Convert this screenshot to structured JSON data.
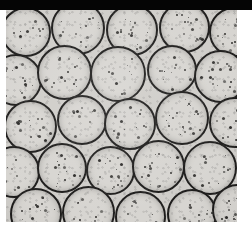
{
  "image": {
    "kind": "grayscale-micrograph",
    "subject": "densely packed spherical cells with dark outlines and internal dark speckle inclusions",
    "alt_text": "Light micrograph of closely packed round cells in a hexagonal-like arrangement",
    "canvas": {
      "width": 252,
      "height": 242
    },
    "field": {
      "x": 6,
      "y": 10,
      "width": 231,
      "height": 212
    },
    "top_band": {
      "height": 10,
      "color": "#050505"
    },
    "colors": {
      "page_background": "#ffffff",
      "field_background": "#cfcdc9",
      "cell_fill": "#d7d5d1",
      "cell_outline": "#1d1c1b",
      "inclusion": "#2a2927",
      "top_band": "#050505"
    },
    "cell_geometry": {
      "mean_diameter_px": 52,
      "outline_width_px": 2,
      "packing": "hexagonal-close-packed",
      "approx_count": 30
    },
    "cells": [
      {
        "cx": 20,
        "cy": 22,
        "d": 50,
        "seed": 3
      },
      {
        "cx": 72,
        "cy": 18,
        "d": 54,
        "seed": 9
      },
      {
        "cx": 126,
        "cy": 20,
        "d": 52,
        "seed": 14
      },
      {
        "cx": 178,
        "cy": 17,
        "d": 51,
        "seed": 5
      },
      {
        "cx": 228,
        "cy": 22,
        "d": 50,
        "seed": 11
      },
      {
        "cx": 10,
        "cy": 70,
        "d": 52,
        "seed": 7
      },
      {
        "cx": 58,
        "cy": 62,
        "d": 55,
        "seed": 2
      },
      {
        "cx": 112,
        "cy": 64,
        "d": 56,
        "seed": 13
      },
      {
        "cx": 166,
        "cy": 60,
        "d": 50,
        "seed": 6
      },
      {
        "cx": 214,
        "cy": 66,
        "d": 53,
        "seed": 10
      },
      {
        "cx": 24,
        "cy": 116,
        "d": 53,
        "seed": 1
      },
      {
        "cx": 76,
        "cy": 110,
        "d": 50,
        "seed": 12
      },
      {
        "cx": 124,
        "cy": 114,
        "d": 52,
        "seed": 4
      },
      {
        "cx": 176,
        "cy": 108,
        "d": 54,
        "seed": 15
      },
      {
        "cx": 228,
        "cy": 112,
        "d": 51,
        "seed": 8
      },
      {
        "cx": 8,
        "cy": 162,
        "d": 52,
        "seed": 16
      },
      {
        "cx": 56,
        "cy": 158,
        "d": 50,
        "seed": 3
      },
      {
        "cx": 104,
        "cy": 160,
        "d": 49,
        "seed": 9
      },
      {
        "cx": 152,
        "cy": 156,
        "d": 53,
        "seed": 5
      },
      {
        "cx": 204,
        "cy": 158,
        "d": 54,
        "seed": 14
      },
      {
        "cx": 30,
        "cy": 204,
        "d": 52,
        "seed": 2
      },
      {
        "cx": 82,
        "cy": 202,
        "d": 53,
        "seed": 11
      },
      {
        "cx": 134,
        "cy": 206,
        "d": 51,
        "seed": 7
      },
      {
        "cx": 186,
        "cy": 204,
        "d": 50,
        "seed": 13
      },
      {
        "cx": 232,
        "cy": 200,
        "d": 52,
        "seed": 6
      }
    ]
  }
}
